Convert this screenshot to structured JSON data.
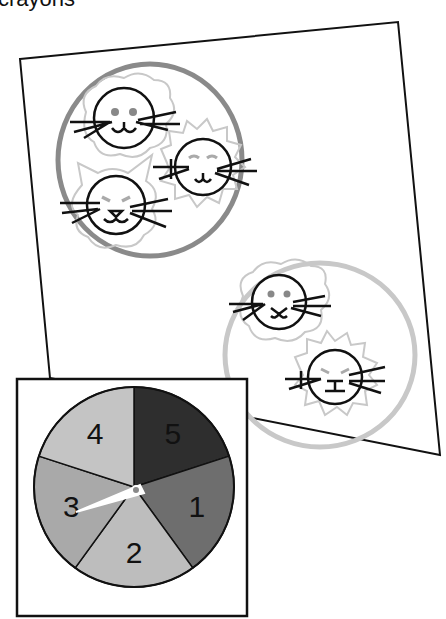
{
  "caption": "crayons",
  "paper": {
    "groups": [
      {
        "name": "large-group",
        "ring_color": "#8a8a8a",
        "cats": [
          {
            "face": "dot-eyes"
          },
          {
            "face": "squint-eyes"
          },
          {
            "face": "angry-eyes-with-ears"
          }
        ]
      },
      {
        "name": "small-group",
        "ring_color": "#c8c8c8",
        "cats": [
          {
            "face": "dot-eyes"
          },
          {
            "face": "squint-eyes"
          }
        ]
      }
    ]
  },
  "spinner": {
    "sections": [
      {
        "label": "5",
        "color": "#2e2e2e"
      },
      {
        "label": "1",
        "color": "#6e6e6e"
      },
      {
        "label": "2",
        "color": "#bdbdbd"
      },
      {
        "label": "3",
        "color": "#a9a9a9"
      },
      {
        "label": "4",
        "color": "#c4c4c4"
      }
    ],
    "pointer_at": "3"
  }
}
